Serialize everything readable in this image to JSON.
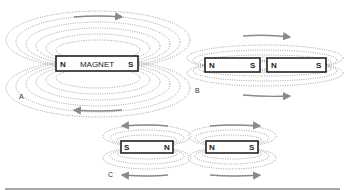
{
  "figure": {
    "panels": [
      {
        "id": "A",
        "label": "A",
        "magnets": [
          {
            "text": "MAGNET",
            "left_pole": "N",
            "right_pole": "S"
          }
        ],
        "arrows": [
          "right (top)",
          "left (bottom)"
        ]
      },
      {
        "id": "B",
        "label": "B",
        "magnets": [
          {
            "left_pole": "N",
            "right_pole": "S"
          },
          {
            "left_pole": "N",
            "right_pole": "S"
          }
        ],
        "arrows": [
          "right (top)",
          "right (bottom)"
        ]
      },
      {
        "id": "C",
        "label": "C",
        "magnets": [
          {
            "left_pole": "S",
            "right_pole": "N"
          },
          {
            "left_pole": "N",
            "right_pole": "S"
          }
        ],
        "arrows": [
          "left (top-left)",
          "right (top-right)",
          "left (bottom-left)",
          "right (bottom-right)"
        ]
      }
    ],
    "colors": {
      "field_lines": "#8a8a8a",
      "magnet_outline": "#222222",
      "arrows": "#8a8a8a"
    }
  }
}
